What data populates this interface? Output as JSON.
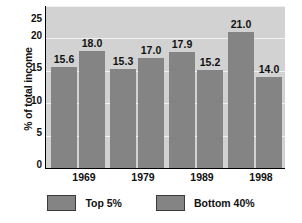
{
  "chart_data": {
    "type": "bar",
    "title": "",
    "xlabel": "",
    "ylabel": "% of total income",
    "ylim": [
      0,
      25
    ],
    "yticks": [
      "0",
      "5",
      "10",
      "15",
      "20",
      "25"
    ],
    "grid": true,
    "legend_position": "bottom",
    "categories": [
      "1969",
      "1979",
      "1989",
      "1998"
    ],
    "series": [
      {
        "name": "Top 5%",
        "values": [
          15.6,
          18.0,
          17.9,
          21.0
        ],
        "labels": [
          "15.6",
          "18.0",
          "17.9",
          "21.0"
        ],
        "color": "#848484"
      },
      {
        "name": "Bottom 40%",
        "values": [
          18.0,
          17.0,
          15.2,
          14.0
        ],
        "labels": [
          "18.0",
          "17.0",
          "15.2",
          "14.0"
        ],
        "color": "#848484"
      }
    ],
    "bar_sequence": [
      {
        "group": "1969",
        "series": "Top 5%",
        "value": 15.6,
        "label": "15.6"
      },
      {
        "group": "1969",
        "series": "Bottom 40%",
        "value": 18.0,
        "label": "18.0"
      },
      {
        "group": "1979",
        "series": "Top 5%",
        "value": 15.3,
        "label": "15.3"
      },
      {
        "group": "1979",
        "series": "Bottom 40%",
        "value": 17.0,
        "label": "17.0"
      },
      {
        "group": "1989",
        "series": "Top 5%",
        "value": 17.9,
        "label": "17.9"
      },
      {
        "group": "1989",
        "series": "Bottom 40%",
        "value": 15.2,
        "label": "15.2"
      },
      {
        "group": "1998",
        "series": "Top 5%",
        "value": 21.0,
        "label": "21.0"
      },
      {
        "group": "1998",
        "series": "Bottom 40%",
        "value": 14.0,
        "label": "14.0"
      }
    ],
    "colors": {
      "bar": "#848484",
      "plot_background": "#d2d2d2",
      "gridline": "#f2f2f2",
      "axis": "#000000",
      "text": "#111111",
      "page_background": "#ffffff"
    }
  },
  "legend": {
    "items": [
      {
        "label": "Top 5%"
      },
      {
        "label": "Bottom 40%"
      }
    ]
  }
}
